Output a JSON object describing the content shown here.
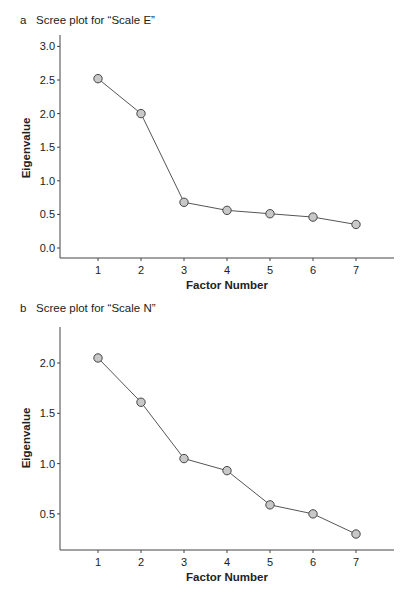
{
  "chart_data": [
    {
      "panel": "a",
      "type": "line",
      "title": "Scree plot for “Scale E”",
      "xlabel": "Factor Number",
      "ylabel": "Eigenvalue",
      "x": [
        1,
        2,
        3,
        4,
        5,
        6,
        7
      ],
      "values": [
        2.52,
        2.0,
        0.68,
        0.56,
        0.51,
        0.46,
        0.35
      ],
      "yticks": [
        "0.0",
        "0.5",
        "1.0",
        "1.5",
        "2.0",
        "2.5",
        "3.0"
      ],
      "xticks": [
        "1",
        "2",
        "3",
        "4",
        "5",
        "6",
        "7"
      ],
      "ylim": [
        -0.15,
        3.15
      ],
      "grid": false,
      "marker": "circle",
      "marker_fill": "#c8c8c8",
      "line_color": "#555555"
    },
    {
      "panel": "b",
      "type": "line",
      "title": "Scree plot for “Scale N”",
      "xlabel": "Factor Number",
      "ylabel": "Eigenvalue",
      "x": [
        1,
        2,
        3,
        4,
        5,
        6,
        7
      ],
      "values": [
        2.05,
        1.61,
        1.05,
        0.93,
        0.59,
        0.5,
        0.3
      ],
      "yticks": [
        "0.5",
        "1.0",
        "1.5",
        "2.0"
      ],
      "xticks": [
        "1",
        "2",
        "3",
        "4",
        "5",
        "6",
        "7"
      ],
      "ylim": [
        0.14,
        2.36
      ],
      "grid": false,
      "marker": "circle",
      "marker_fill": "#c8c8c8",
      "line_color": "#555555"
    }
  ],
  "panels": [
    {
      "letter": "a",
      "title": "Scree plot for “Scale E”"
    },
    {
      "letter": "b",
      "title": "Scree plot for “Scale N”"
    }
  ]
}
